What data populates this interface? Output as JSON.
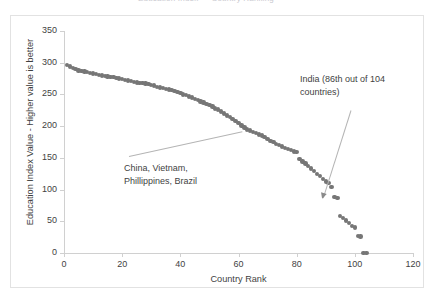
{
  "title_strip": {
    "text": "Education Index — Country Ranking"
  },
  "chart_data": {
    "type": "scatter",
    "title": "",
    "xlabel": "Country Rank",
    "ylabel": "Education Index Value - Higher value is better",
    "xlim": [
      0,
      120
    ],
    "ylim": [
      0,
      350
    ],
    "xticks": [
      0,
      20,
      40,
      60,
      80,
      100,
      120
    ],
    "yticks": [
      0,
      50,
      100,
      150,
      200,
      250,
      300,
      350
    ],
    "grid": false,
    "legend": null,
    "marker_color": "#767676",
    "series": [
      {
        "name": "Education Index Value",
        "x": [
          1,
          2,
          3,
          4,
          5,
          6,
          7,
          8,
          9,
          10,
          11,
          12,
          13,
          14,
          15,
          16,
          17,
          18,
          19,
          20,
          21,
          22,
          23,
          24,
          25,
          26,
          27,
          28,
          29,
          30,
          31,
          32,
          33,
          34,
          35,
          36,
          37,
          38,
          39,
          40,
          41,
          42,
          43,
          44,
          45,
          46,
          47,
          48,
          49,
          50,
          51,
          52,
          53,
          54,
          55,
          56,
          57,
          58,
          59,
          60,
          61,
          62,
          63,
          64,
          65,
          66,
          67,
          68,
          69,
          70,
          71,
          72,
          73,
          74,
          75,
          76,
          77,
          78,
          79,
          80,
          81,
          82,
          83,
          84,
          85,
          86,
          87,
          88,
          89,
          90,
          91,
          92,
          93,
          94,
          95,
          96,
          97,
          98,
          99,
          100,
          101,
          102,
          103,
          104
        ],
        "y": [
          296,
          294,
          292,
          290,
          288,
          287,
          286,
          285,
          284,
          283,
          282,
          281,
          280,
          279,
          278,
          277,
          277,
          276,
          275,
          274,
          273,
          272,
          271,
          270,
          269,
          268,
          268,
          267,
          266,
          265,
          264,
          262,
          261,
          260,
          259,
          258,
          257,
          255,
          254,
          252,
          250,
          249,
          247,
          245,
          243,
          241,
          239,
          237,
          235,
          233,
          231,
          228,
          226,
          223,
          220,
          217,
          214,
          211,
          208,
          205,
          201,
          198,
          195,
          193,
          191,
          189,
          187,
          185,
          183,
          180,
          177,
          175,
          172,
          170,
          168,
          166,
          164,
          162,
          160,
          159,
          148,
          144,
          141,
          137,
          133,
          129,
          125,
          121,
          117,
          113,
          110,
          104,
          88,
          87,
          58,
          55,
          51,
          47,
          43,
          40,
          27,
          26,
          0,
          0
        ]
      }
    ],
    "annotations": [
      {
        "id": "cluster",
        "lines": [
          "China, Vietnam,",
          "Phillippines, Brazil"
        ],
        "points_to_rank": 62,
        "points_to_value": 195
      },
      {
        "id": "india",
        "lines": [
          "India (86th out of 104",
          "countries)"
        ],
        "points_to_rank": 86,
        "points_to_value": 129
      }
    ]
  }
}
